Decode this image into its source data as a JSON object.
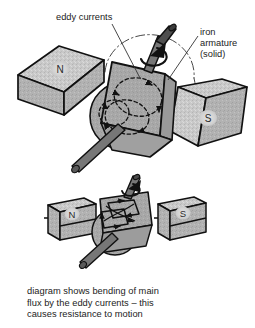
{
  "figure": {
    "title_alt": "eddy currents in a rotating iron armature between magnet poles",
    "background": "#ffffff",
    "ink": "#111111",
    "magnet_fill": "#c9c9c9",
    "magnet_fill_dark": "#b0b0b0",
    "armature_fill": "#a8a8a8",
    "armature_fill_dark": "#9a9a9a",
    "shaft_fill": "#6e6e6e",
    "shaft_fill_dark": "#4a4a4a"
  },
  "labels": {
    "eddy_currents": "eddy currents",
    "iron_armature_line1": "iron",
    "iron_armature_line2": "armature",
    "iron_armature_line3": "(solid)"
  },
  "upper_diagram": {
    "north_pole": "N",
    "south_pole": "S"
  },
  "lower_diagram": {
    "north_pole": "N",
    "south_pole": "S"
  },
  "caption": {
    "line1": "diagram shows bending of main",
    "line2": "flux by the eddy currents – this",
    "line3": "causes resistance to motion"
  }
}
